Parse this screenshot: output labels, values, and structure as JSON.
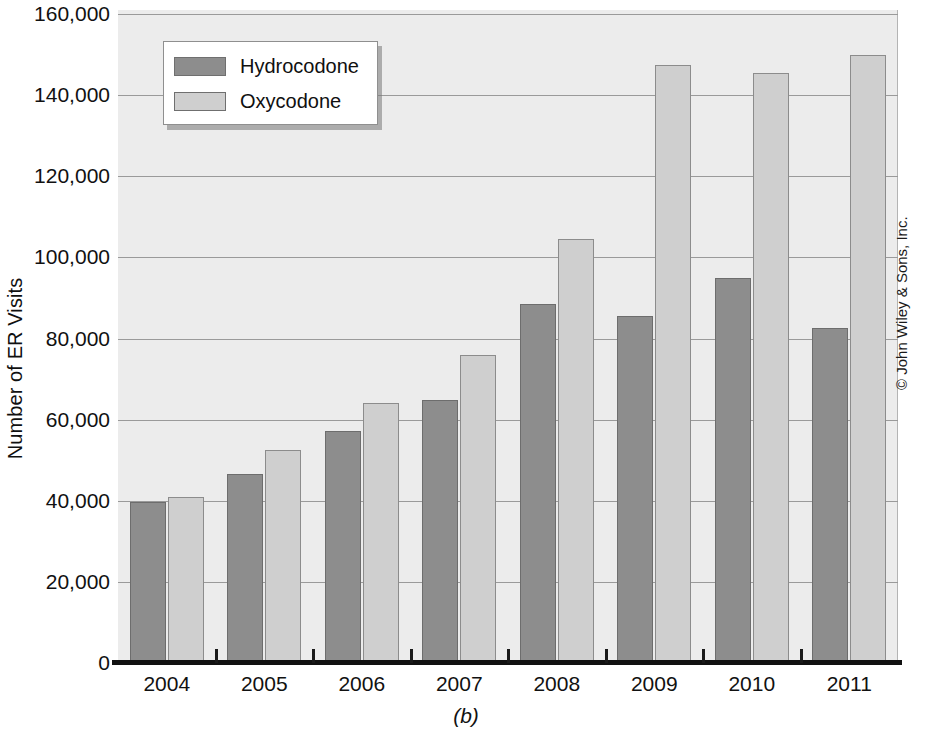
{
  "figure": {
    "caption": "(b)",
    "copyright": "© John Wiley & Sons, Inc."
  },
  "chart_data": {
    "type": "bar",
    "title": "",
    "xlabel": "",
    "ylabel": "Number of ER Visits",
    "categories": [
      "2004",
      "2005",
      "2006",
      "2007",
      "2008",
      "2009",
      "2010",
      "2011"
    ],
    "series": [
      {
        "name": "Hydrocodone",
        "color": "#8d8d8d",
        "values": [
          39800,
          46500,
          57200,
          64800,
          88500,
          85500,
          95000,
          82500
        ]
      },
      {
        "name": "Oxycodone",
        "color": "#cfcfcf",
        "values": [
          41000,
          52400,
          64200,
          76000,
          104500,
          147500,
          145500,
          150000
        ]
      }
    ],
    "ylim": [
      0,
      160000
    ],
    "yticks": [
      0,
      20000,
      40000,
      60000,
      80000,
      100000,
      120000,
      140000,
      160000
    ],
    "ytick_labels": [
      "0",
      "20,000",
      "40,000",
      "60,000",
      "80,000",
      "100,000",
      "120,000",
      "140,000",
      "160,000"
    ],
    "grid": true,
    "legend_position": "upper-left",
    "plot_background": "#ececec",
    "gridline_color": "#9a9a9a"
  }
}
